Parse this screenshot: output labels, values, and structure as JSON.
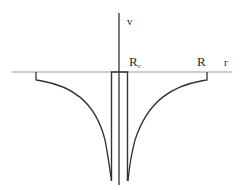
{
  "diagram": {
    "type": "potential-well-plot",
    "axes": {
      "vertical_label": "v",
      "horizontal_label": "r"
    },
    "labels": {
      "inner_radius": "R",
      "inner_radius_sub": "c",
      "outer_radius": "R"
    },
    "colors": {
      "stroke": "#333333",
      "axis": "#8a8a8a",
      "background": "#ffffff"
    }
  }
}
